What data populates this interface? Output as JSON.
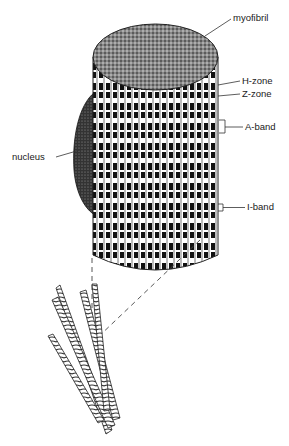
{
  "diagram": {
    "labels": {
      "myofibril": "myofibril",
      "h_zone": "H-zone",
      "z_zone": "Z-zone",
      "a_band": "A-band",
      "nucleus": "nucleus",
      "i_band": "I-band"
    },
    "colors": {
      "ink": "#111111",
      "paper": "#ffffff",
      "line": "#333333"
    }
  }
}
